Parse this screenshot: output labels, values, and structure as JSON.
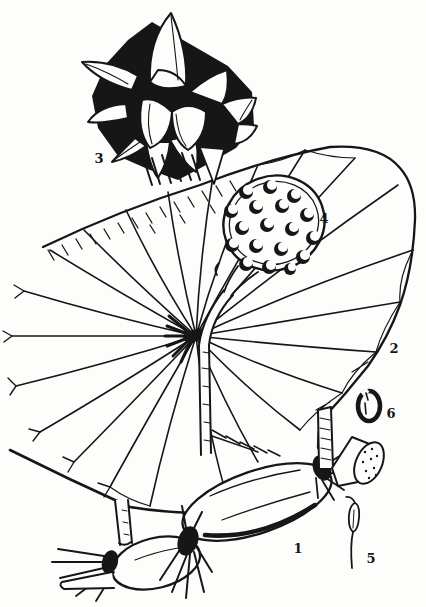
{
  "illustration": {
    "ink_color": "#161616",
    "paper_color": "#fdfdfc",
    "labels": [
      {
        "number": "1",
        "part": "rhizome"
      },
      {
        "number": "2",
        "part": "leaf"
      },
      {
        "number": "3",
        "part": "flower"
      },
      {
        "number": "4",
        "part": "seed-pod"
      },
      {
        "number": "5",
        "part": "stamen"
      },
      {
        "number": "6",
        "part": "seed"
      }
    ]
  }
}
